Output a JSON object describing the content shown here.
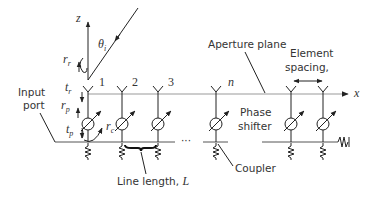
{
  "diagram": {
    "type": "phased-array-schematic",
    "axes": {
      "z_label": "z",
      "x_label": "x",
      "angle_label": "θ",
      "angle_subscript": "i"
    },
    "labels": {
      "input_port": [
        "Input",
        "port"
      ],
      "aperture_plane": "Aperture plane",
      "element_spacing": [
        "Element",
        "spacing, "
      ],
      "element_spacing_var": "d",
      "phase_shifter": [
        "Phase",
        "shifter"
      ],
      "coupler": "Coupler",
      "line_length": "Line length, ",
      "line_length_var": "L",
      "ellipsis": "···"
    },
    "reflection_coeffs": [
      {
        "base": "r",
        "sub": "r"
      },
      {
        "base": "t",
        "sub": "r"
      },
      {
        "base": "r",
        "sub": "p"
      },
      {
        "base": "t",
        "sub": "p"
      },
      {
        "base": "r",
        "sub": "c"
      }
    ],
    "element_numbers": [
      "1",
      "2",
      "3",
      "n"
    ],
    "elements_x": [
      88,
      122,
      158,
      216,
      291,
      323
    ],
    "colors": {
      "line": "#555555",
      "aperture": "#999999",
      "text": "#333333"
    }
  }
}
